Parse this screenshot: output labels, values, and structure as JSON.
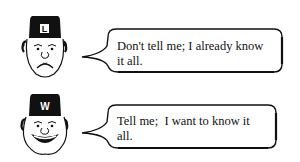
{
  "panels": [
    {
      "character": "frowning-man-with-cap",
      "cap_letter": "L",
      "speech": "Don't tell me; I already know it all."
    },
    {
      "character": "smiling-man-with-cap",
      "cap_letter": "W",
      "speech": "Tell me;  I want to know it all."
    }
  ]
}
